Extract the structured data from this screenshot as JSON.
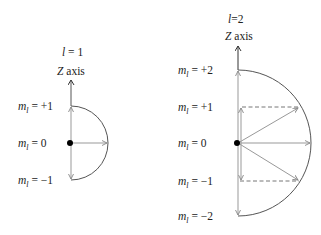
{
  "diagrams": [
    {
      "title": "l=1",
      "l_value": 1,
      "axis_label": "Z axis",
      "levels": [
        {
          "label": "m",
          "sub": "l",
          "value": "= +1",
          "m": 1
        },
        {
          "label": "m",
          "sub": "l",
          "value": "=    0",
          "m": 0
        },
        {
          "label": "m",
          "sub": "l",
          "value": "= −1",
          "m": -1
        }
      ]
    },
    {
      "title": "l=2",
      "l_value": 2,
      "axis_label": "Z axis",
      "levels": [
        {
          "label": "m",
          "sub": "l",
          "value": "= +2",
          "m": 2
        },
        {
          "label": "m",
          "sub": "l",
          "value": "= +1",
          "m": 1
        },
        {
          "label": "m",
          "sub": "l",
          "value": "=    0",
          "m": 0
        },
        {
          "label": "m",
          "sub": "l",
          "value": "= −1",
          "m": -1
        },
        {
          "label": "m",
          "sub": "l",
          "value": "= −2",
          "m": -2
        }
      ]
    }
  ],
  "colors": {
    "curve": "#555555",
    "vector": "#999999",
    "dashed": "#777777",
    "dot": "#000000",
    "text": "#222222"
  }
}
